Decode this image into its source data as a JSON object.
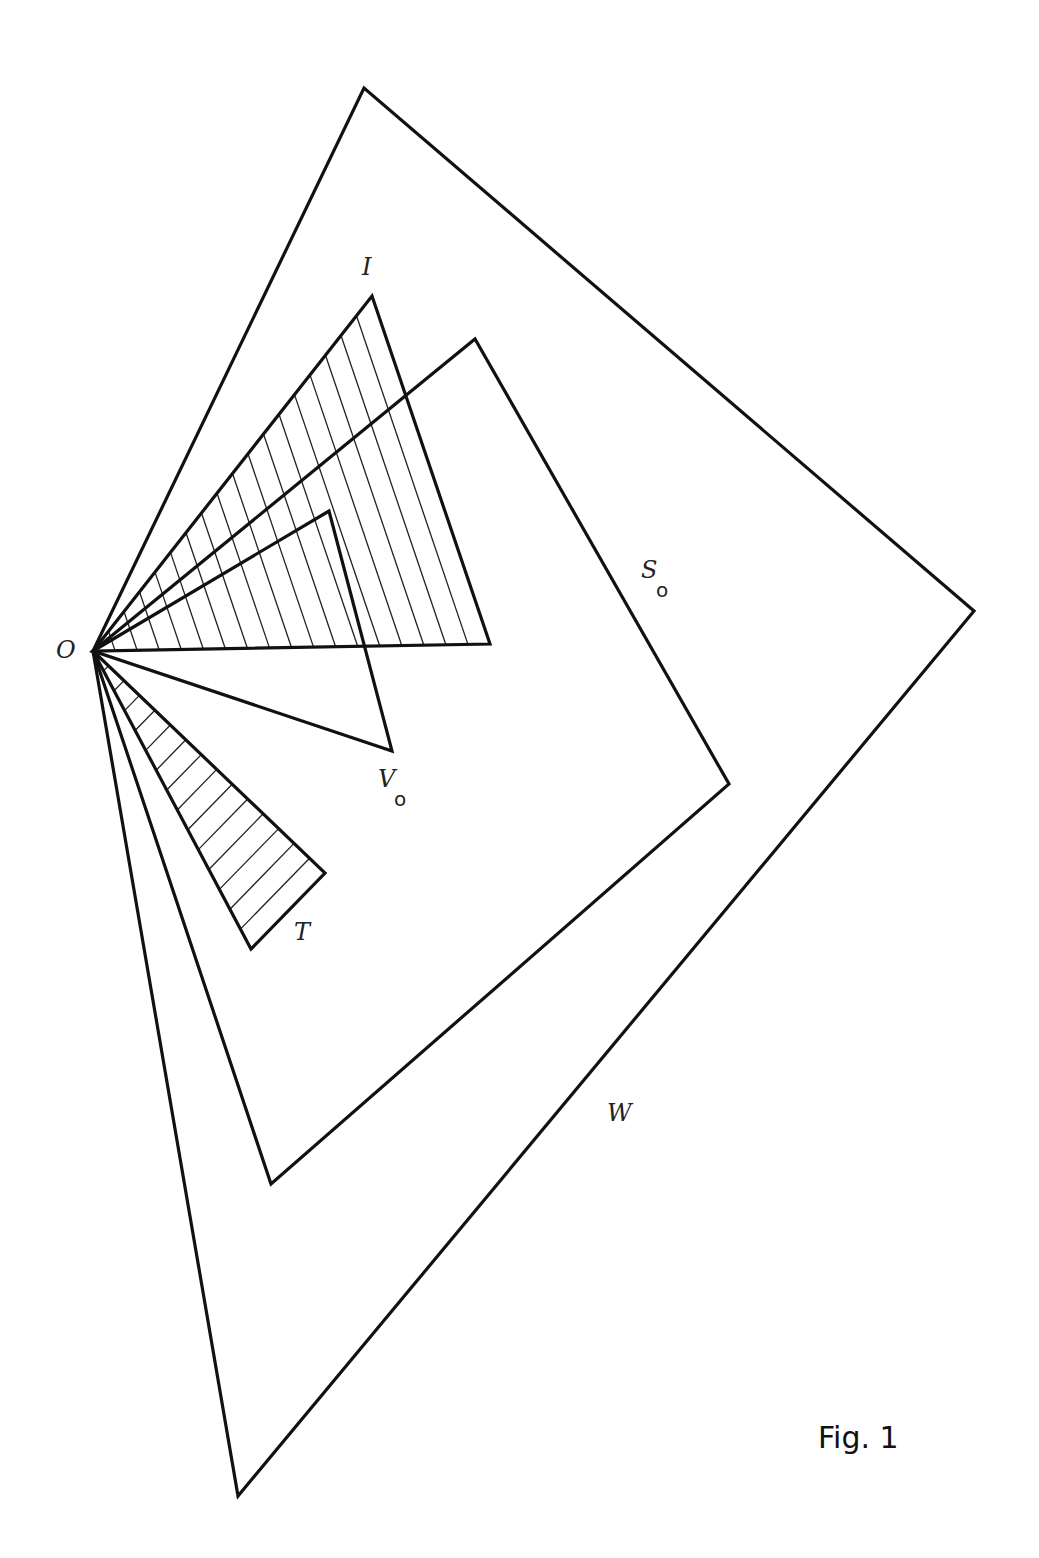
{
  "figure": {
    "caption": "Fig. 1",
    "origin": {
      "name": "O",
      "x": 93,
      "y": 651
    },
    "stroke_color": "#111111",
    "background": "#ffffff"
  },
  "labels": {
    "O": {
      "text": "O",
      "x": 56,
      "y": 658
    },
    "I": {
      "text": "I",
      "x": 362,
      "y": 275
    },
    "S0": {
      "text": "S",
      "sub": "o",
      "x": 641,
      "y": 578,
      "sub_x": 656,
      "sub_y": 597
    },
    "V0": {
      "text": "V",
      "sub": "o",
      "x": 378,
      "y": 787,
      "sub_x": 394,
      "sub_y": 806
    },
    "T": {
      "text": "T",
      "x": 294,
      "y": 940
    },
    "W": {
      "text": "W",
      "x": 607,
      "y": 1121
    }
  },
  "shapes": [
    {
      "name": "W",
      "points": [
        [
          93,
          651
        ],
        [
          364,
          88
        ],
        [
          974,
          611
        ],
        [
          238,
          1496
        ]
      ],
      "hatched": false
    },
    {
      "name": "S0",
      "points": [
        [
          93,
          651
        ],
        [
          475,
          339
        ],
        [
          729,
          784
        ],
        [
          271,
          1184
        ]
      ],
      "hatched": false
    },
    {
      "name": "I",
      "points": [
        [
          93,
          651
        ],
        [
          372,
          296
        ],
        [
          490,
          644
        ]
      ],
      "hatched": true,
      "hatch_lines": 17
    },
    {
      "name": "V0",
      "points": [
        [
          93,
          651
        ],
        [
          329,
          511
        ],
        [
          392,
          751
        ]
      ],
      "hatched": false
    },
    {
      "name": "T",
      "points": [
        [
          93,
          651
        ],
        [
          325,
          873
        ],
        [
          251,
          949
        ]
      ],
      "hatched": true,
      "hatch_lines": 14
    }
  ]
}
